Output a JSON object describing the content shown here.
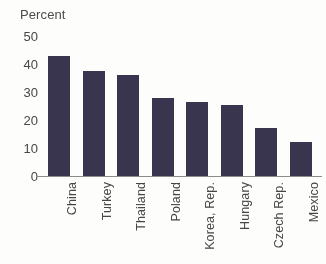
{
  "chart_data": {
    "type": "bar",
    "title": "",
    "ylabel": "Percent",
    "xlabel": "",
    "ylim": [
      0,
      50
    ],
    "yticks": [
      "0",
      "10",
      "20",
      "30",
      "40",
      "50"
    ],
    "grid": false,
    "legend": "none",
    "orientation": "vertical",
    "bar_color": "#38334e",
    "categories": [
      "China",
      "Turkey",
      "Thailand",
      "Poland",
      "Korea, Rep.",
      "Hungary",
      "Czech Rep.",
      "Mexico"
    ],
    "values": [
      43,
      37.5,
      36,
      28,
      26.5,
      25.5,
      17,
      12
    ]
  },
  "axis": {
    "y_title": "Percent",
    "ticks": [
      {
        "label": "50",
        "value": 50
      },
      {
        "label": "40",
        "value": 40
      },
      {
        "label": "30",
        "value": 30
      },
      {
        "label": "20",
        "value": 20
      },
      {
        "label": "10",
        "value": 10
      },
      {
        "label": "0",
        "value": 0
      }
    ]
  },
  "bars": [
    {
      "label": "China",
      "value": 43
    },
    {
      "label": "Turkey",
      "value": 37.5
    },
    {
      "label": "Thailand",
      "value": 36
    },
    {
      "label": "Poland",
      "value": 28
    },
    {
      "label": "Korea, Rep.",
      "value": 26.5
    },
    {
      "label": "Hungary",
      "value": 25.5
    },
    {
      "label": "Czech Rep.",
      "value": 17
    },
    {
      "label": "Mexico",
      "value": 12
    }
  ]
}
